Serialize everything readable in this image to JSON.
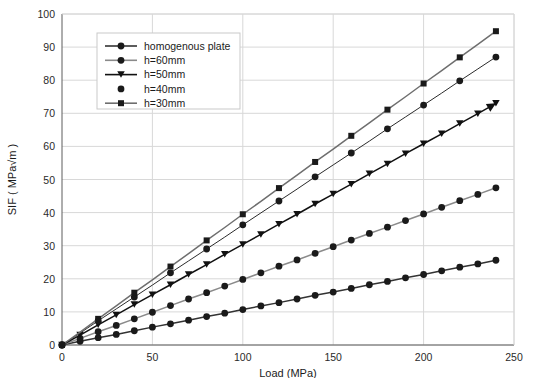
{
  "chart_data": {
    "type": "line",
    "title": "",
    "xlabel": "Load (MPa)",
    "ylabel": "SIF ( MPa√m )",
    "xlim": [
      0,
      250
    ],
    "ylim": [
      0,
      100
    ],
    "xticks": [
      0,
      50,
      100,
      150,
      200,
      250
    ],
    "yticks": [
      0,
      10,
      20,
      30,
      40,
      50,
      60,
      70,
      80,
      90,
      100
    ],
    "grid": true,
    "legend_position": "upper-left",
    "x": [
      0,
      10,
      20,
      30,
      40,
      50,
      60,
      70,
      80,
      90,
      100,
      110,
      120,
      130,
      140,
      150,
      160,
      170,
      180,
      190,
      200,
      210,
      220,
      230,
      240
    ],
    "series": [
      {
        "name": "homogenous plate",
        "marker": "circle",
        "color": "#333333",
        "values": [
          0,
          1.1,
          2.2,
          3.2,
          4.3,
          5.4,
          6.4,
          7.5,
          8.6,
          9.6,
          10.7,
          11.8,
          12.8,
          13.9,
          15.0,
          16.0,
          17.1,
          18.2,
          19.2,
          20.3,
          21.3,
          22.4,
          23.5,
          24.5,
          25.6
        ]
      },
      {
        "name": "h=60mm",
        "marker": "circle",
        "color": "#8a8a8a",
        "values": [
          0,
          2.0,
          4.0,
          5.9,
          7.9,
          9.9,
          11.9,
          13.9,
          15.8,
          17.8,
          19.8,
          21.8,
          23.8,
          25.7,
          27.7,
          29.7,
          31.7,
          33.7,
          35.6,
          37.6,
          39.6,
          41.6,
          43.6,
          45.5,
          47.5
        ]
      },
      {
        "name": "h=50mm",
        "marker": "triangle-down",
        "color": "#111111",
        "values": [
          0,
          3.0,
          6.1,
          9.1,
          12.2,
          15.2,
          18.2,
          21.3,
          24.3,
          27.4,
          30.4,
          33.4,
          36.5,
          39.5,
          42.6,
          45.6,
          48.6,
          51.7,
          54.7,
          57.8,
          60.8,
          63.8,
          66.9,
          69.9,
          73.0
        ]
      },
      {
        "name": "h=40mm",
        "marker": "circle-nofill-line",
        "color": "#2b2b2b",
        "values": [
          0,
          3.6,
          7.3,
          10.9,
          14.5,
          18.1,
          21.8,
          25.4,
          29.0,
          32.6,
          36.3,
          39.9,
          43.5,
          47.1,
          50.8,
          54.4,
          58.0,
          61.6,
          65.3,
          68.9,
          72.5,
          76.1,
          79.8,
          83.4,
          87.0
        ]
      },
      {
        "name": "h=30mm",
        "marker": "square",
        "color": "#6e6e6e",
        "values": [
          0,
          3.9,
          7.9,
          11.8,
          15.8,
          19.7,
          23.7,
          27.6,
          31.6,
          35.5,
          39.5,
          43.4,
          47.4,
          51.3,
          55.3,
          59.2,
          63.2,
          67.1,
          71.1,
          75.0,
          79.0,
          82.9,
          86.9,
          90.8,
          94.8
        ]
      }
    ]
  }
}
